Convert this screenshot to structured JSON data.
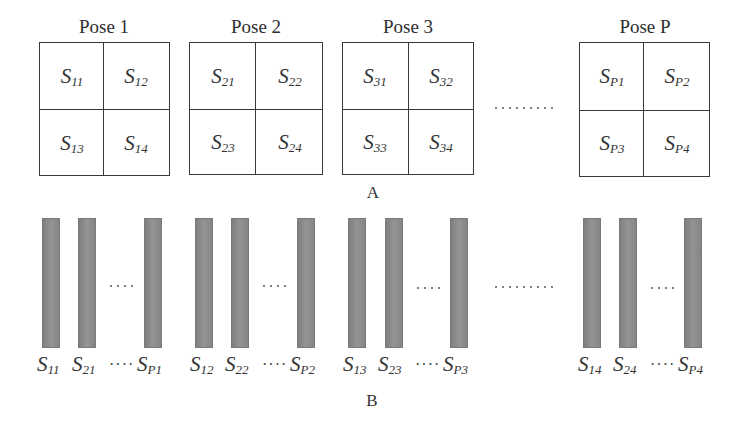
{
  "diagram": {
    "section_a": {
      "label": "A",
      "poses": [
        {
          "title": "Pose 1",
          "cells": [
            {
              "s": "S",
              "sub": "11"
            },
            {
              "s": "S",
              "sub": "12"
            },
            {
              "s": "S",
              "sub": "13"
            },
            {
              "s": "S",
              "sub": "14"
            }
          ]
        },
        {
          "title": "Pose 2",
          "cells": [
            {
              "s": "S",
              "sub": "21"
            },
            {
              "s": "S",
              "sub": "22"
            },
            {
              "s": "S",
              "sub": "23"
            },
            {
              "s": "S",
              "sub": "24"
            }
          ]
        },
        {
          "title": "Pose 3",
          "cells": [
            {
              "s": "S",
              "sub": "31"
            },
            {
              "s": "S",
              "sub": "32"
            },
            {
              "s": "S",
              "sub": "33"
            },
            {
              "s": "S",
              "sub": "34"
            }
          ]
        },
        {
          "title": "Pose P",
          "cells": [
            {
              "s": "S",
              "sub": "P1"
            },
            {
              "s": "S",
              "sub": "P2"
            },
            {
              "s": "S",
              "sub": "P3"
            },
            {
              "s": "S",
              "sub": "P4"
            }
          ]
        }
      ],
      "gap_ellipsis": "·········"
    },
    "section_b": {
      "label": "B",
      "groups": [
        {
          "bars": [
            {
              "s": "S",
              "sub": "11"
            },
            {
              "s": "S",
              "sub": "21"
            },
            {
              "s": "S",
              "sub": "P1"
            }
          ],
          "inner_ellipsis": "····"
        },
        {
          "bars": [
            {
              "s": "S",
              "sub": "12"
            },
            {
              "s": "S",
              "sub": "22"
            },
            {
              "s": "S",
              "sub": "P2"
            }
          ],
          "inner_ellipsis": "····"
        },
        {
          "bars": [
            {
              "s": "S",
              "sub": "13"
            },
            {
              "s": "S",
              "sub": "23"
            },
            {
              "s": "S",
              "sub": "P3"
            }
          ],
          "inner_ellipsis": "····"
        },
        {
          "bars": [
            {
              "s": "S",
              "sub": "14"
            },
            {
              "s": "S",
              "sub": "24"
            },
            {
              "s": "S",
              "sub": "P4"
            }
          ],
          "inner_ellipsis": "····"
        }
      ],
      "gap_ellipsis": "·········"
    },
    "colors": {
      "line": "#3a3a3a",
      "bar": "#8c8c8c",
      "text": "#333333"
    }
  }
}
